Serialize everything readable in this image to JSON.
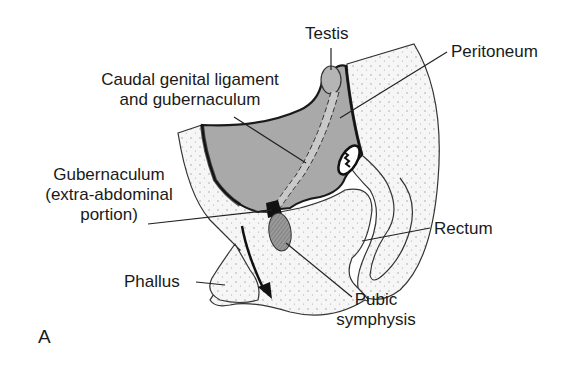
{
  "figure": {
    "panel_label": "A",
    "labels": {
      "testis": "Testis",
      "peritoneum": "Peritoneum",
      "caudal_line1": "Caudal genital ligament",
      "caudal_line2": "and gubernaculum",
      "gub_line1": "Gubernaculum",
      "gub_line2": "(extra-abdominal",
      "gub_line3": "portion)",
      "rectum": "Rectum",
      "phallus": "Phallus",
      "pubic_line1": "Pubic",
      "pubic_line2": "symphysis"
    },
    "colors": {
      "peritoneal_fill": "#a9a9a9",
      "body_fill": "#f4f4f4",
      "pubic_fill": "#8f8f8f",
      "outline": "#222222"
    }
  }
}
